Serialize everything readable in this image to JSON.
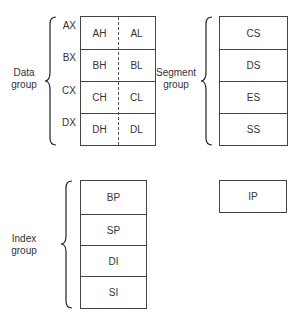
{
  "data_group": {
    "label_line1": "Data",
    "label_line2": "group",
    "registers": [
      {
        "name": "AX",
        "high": "AH",
        "low": "AL"
      },
      {
        "name": "BX",
        "high": "BH",
        "low": "BL"
      },
      {
        "name": "CX",
        "high": "CH",
        "low": "CL"
      },
      {
        "name": "DX",
        "high": "DH",
        "low": "DL"
      }
    ]
  },
  "segment_group": {
    "label_line1": "Segment",
    "label_line2": "group",
    "registers": [
      "CS",
      "DS",
      "ES",
      "SS"
    ]
  },
  "index_group": {
    "label_line1": "Index",
    "label_line2": "group",
    "registers": [
      "BP",
      "SP",
      "DI",
      "SI"
    ]
  },
  "instruction_pointer": {
    "register": "IP"
  }
}
